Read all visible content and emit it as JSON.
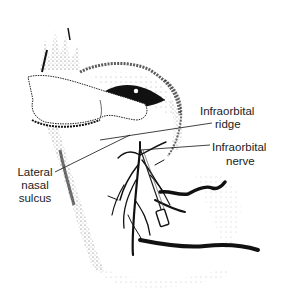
{
  "figure": {
    "style": "black-and-white stipple line drawing",
    "colors": {
      "ink": "#111111",
      "stipple": "#555555",
      "background": "#ffffff",
      "label_text": "#222222"
    }
  },
  "labels": {
    "infraorbital_ridge": {
      "line1": "Infraorbital",
      "line2": "ridge"
    },
    "infraorbital_nerve": {
      "line1": "Infraorbital",
      "line2": "nerve"
    },
    "lateral_nasal_sulcus": {
      "line1": "Lateral",
      "line2": "nasal",
      "line3": "sulcus"
    }
  }
}
